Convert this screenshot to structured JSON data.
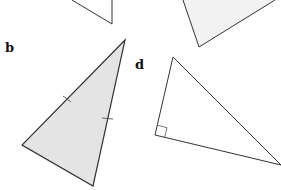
{
  "diagram": {
    "type": "triangles",
    "colors": {
      "stroke": "#333333",
      "fill_shaded": "#e4e4e4",
      "fill_light": "#f2f2f2",
      "background": "#ffffff"
    },
    "labels": {
      "b": "b",
      "d": "d"
    },
    "triangles": [
      {
        "id": "a",
        "label_visible": false,
        "points": "72,0 112,24 112,0",
        "fill": "none"
      },
      {
        "id": "c",
        "label_visible": false,
        "points": "183,0 199,47 275,0",
        "fill": "light"
      },
      {
        "id": "b",
        "label_visible": true,
        "points": "125,40 22,145 93,186",
        "fill": "shaded",
        "equal_side_ticks": 2
      },
      {
        "id": "d",
        "label_visible": true,
        "points": "173,57 155,135 281,165",
        "fill": "none",
        "right_angle_at": "155,135"
      }
    ]
  }
}
